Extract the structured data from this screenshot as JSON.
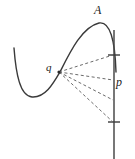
{
  "figure": {
    "name": "tangent-line-diagram",
    "background_color": "#ffffff",
    "stroke_color": "#3a3a3a",
    "dash_color": "#6b6b6b",
    "width": 135,
    "height": 159,
    "labels": {
      "apex": "A",
      "vertex": "q",
      "point_on_line": "p"
    },
    "curve": {
      "name": "cubic-curve",
      "path": "M 14 48 C 16 74, 20 96, 32 97 C 45 98, 53 84, 60 72 C 70 52, 82 27, 99 23 C 110 21, 115 40, 116 72",
      "description": "Smooth cubic-like curve descending from upper left into a valley then rising to a peak at A and falling to the right"
    },
    "vertical_line": {
      "name": "vertical-line",
      "x": 114,
      "y_top": 30,
      "y_bottom": 159
    },
    "tick_marks": [
      {
        "name": "tick-upper",
        "x": 114,
        "y": 55,
        "half_width": 6
      },
      {
        "name": "tick-lower",
        "x": 114,
        "y": 122,
        "half_width": 6
      }
    ],
    "fan_origin": {
      "name": "fan-origin",
      "x": 59,
      "y": 72
    },
    "dashed_rays": [
      {
        "name": "dashed-ray-1",
        "x1": 59,
        "y1": 72,
        "x2": 113,
        "y2": 55
      },
      {
        "name": "dashed-ray-2",
        "x1": 59,
        "y1": 72,
        "x2": 113,
        "y2": 80
      },
      {
        "name": "dashed-ray-3",
        "x1": 59,
        "y1": 72,
        "x2": 113,
        "y2": 100
      },
      {
        "name": "dashed-ray-4",
        "x1": 59,
        "y1": 72,
        "x2": 113,
        "y2": 122
      }
    ]
  }
}
